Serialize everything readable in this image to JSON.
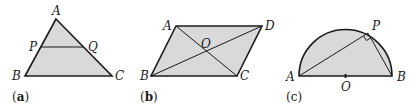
{
  "figures": [
    {
      "id": "a",
      "caption_letter": "a",
      "description": "Triangle ABC with segment PQ parallel to BC",
      "labels": {
        "A": "A",
        "B": "B",
        "C": "C",
        "P": "P",
        "Q": "Q"
      }
    },
    {
      "id": "b",
      "caption_letter": "b",
      "description": "Parallelogram ABCD with diagonals intersecting at O",
      "labels": {
        "A": "A",
        "B": "B",
        "C": "C",
        "D": "D",
        "O": "O"
      }
    },
    {
      "id": "c",
      "caption_letter": "c",
      "description": "Semicircle on diameter AB with centre O, point P on arc, right angle at P",
      "labels": {
        "A": "A",
        "B": "B",
        "P": "P",
        "O": "O"
      }
    }
  ],
  "colors": {
    "fill": "#d9d9d9",
    "stroke": "#1a1a1a"
  }
}
